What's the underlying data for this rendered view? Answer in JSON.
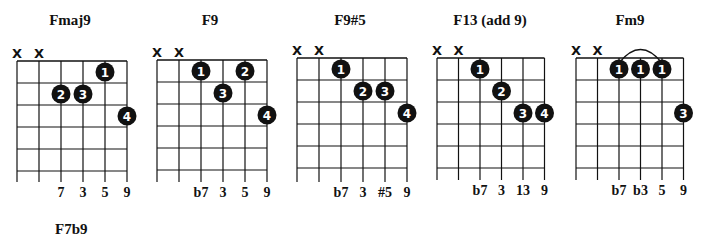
{
  "diagrams": [
    {
      "name": "Fmaj9",
      "offset_x": 0,
      "grid": {
        "x0": 17,
        "dx": 22,
        "y0": 61,
        "dy": 22,
        "frets": 5,
        "bottom": 182
      },
      "muted": [
        0,
        1
      ],
      "dots": [
        {
          "string": 4,
          "fret": 1,
          "finger": "1"
        },
        {
          "string": 2,
          "fret": 2,
          "finger": "2"
        },
        {
          "string": 3,
          "fret": 2,
          "finger": "3"
        },
        {
          "string": 5,
          "fret": 3,
          "finger": "4"
        }
      ],
      "barre": null,
      "intervals": [
        {
          "string": 2,
          "label": "7"
        },
        {
          "string": 3,
          "label": "3"
        },
        {
          "string": 4,
          "label": "5"
        },
        {
          "string": 5,
          "label": "9"
        }
      ]
    },
    {
      "name": "F9",
      "offset_x": 140,
      "grid": {
        "x0": 17,
        "dx": 22,
        "y0": 60,
        "dy": 22,
        "frets": 5,
        "bottom": 182
      },
      "muted": [
        0,
        1
      ],
      "dots": [
        {
          "string": 2,
          "fret": 1,
          "finger": "1"
        },
        {
          "string": 4,
          "fret": 1,
          "finger": "2"
        },
        {
          "string": 3,
          "fret": 2,
          "finger": "3"
        },
        {
          "string": 5,
          "fret": 3,
          "finger": "4"
        }
      ],
      "barre": null,
      "intervals": [
        {
          "string": 2,
          "label": "b7"
        },
        {
          "string": 3,
          "label": "3"
        },
        {
          "string": 4,
          "label": "5"
        },
        {
          "string": 5,
          "label": "9"
        }
      ]
    },
    {
      "name": "F9#5",
      "offset_x": 280,
      "grid": {
        "x0": 17,
        "dx": 22,
        "y0": 58,
        "dy": 22,
        "frets": 5,
        "bottom": 182
      },
      "muted": [
        0,
        1
      ],
      "dots": [
        {
          "string": 2,
          "fret": 1,
          "finger": "1"
        },
        {
          "string": 3,
          "fret": 2,
          "finger": "2"
        },
        {
          "string": 4,
          "fret": 2,
          "finger": "3"
        },
        {
          "string": 5,
          "fret": 3,
          "finger": "4"
        }
      ],
      "barre": null,
      "intervals": [
        {
          "string": 2,
          "label": "b7"
        },
        {
          "string": 3,
          "label": "3"
        },
        {
          "string": 4,
          "label": "#5"
        },
        {
          "string": 5,
          "label": "9"
        }
      ]
    },
    {
      "name": "F13 (add 9)",
      "offset_x": 420,
      "grid": {
        "x0": 17,
        "dx": 21.5,
        "y0": 58,
        "dy": 22,
        "frets": 5,
        "bottom": 180
      },
      "muted": [
        0,
        1
      ],
      "dots": [
        {
          "string": 2,
          "fret": 1,
          "finger": "1"
        },
        {
          "string": 3,
          "fret": 2,
          "finger": "2"
        },
        {
          "string": 4,
          "fret": 3,
          "finger": "3"
        },
        {
          "string": 5,
          "fret": 3,
          "finger": "4"
        }
      ],
      "barre": null,
      "intervals": [
        {
          "string": 2,
          "label": "b7"
        },
        {
          "string": 3,
          "label": "3"
        },
        {
          "string": 4,
          "label": "13"
        },
        {
          "string": 5,
          "label": "9"
        }
      ]
    },
    {
      "name": "Fm9",
      "offset_x": 560,
      "grid": {
        "x0": 16,
        "dx": 21.5,
        "y0": 58,
        "dy": 22,
        "frets": 5,
        "bottom": 180
      },
      "muted": [
        0,
        1
      ],
      "dots": [
        {
          "string": 2,
          "fret": 1,
          "finger": "1"
        },
        {
          "string": 3,
          "fret": 1,
          "finger": "1"
        },
        {
          "string": 4,
          "fret": 1,
          "finger": "1"
        },
        {
          "string": 5,
          "fret": 3,
          "finger": "3"
        }
      ],
      "barre": {
        "from": 2,
        "to": 4
      },
      "intervals": [
        {
          "string": 2,
          "label": "b7"
        },
        {
          "string": 3,
          "label": "b3"
        },
        {
          "string": 4,
          "label": "5"
        },
        {
          "string": 5,
          "label": "9"
        }
      ]
    }
  ],
  "next_title": "F7b9",
  "muted_symbol": "X",
  "colors": {
    "ink": "#111111",
    "dot": "#111111",
    "dot_text": "#ffffff",
    "background": "#ffffff"
  }
}
